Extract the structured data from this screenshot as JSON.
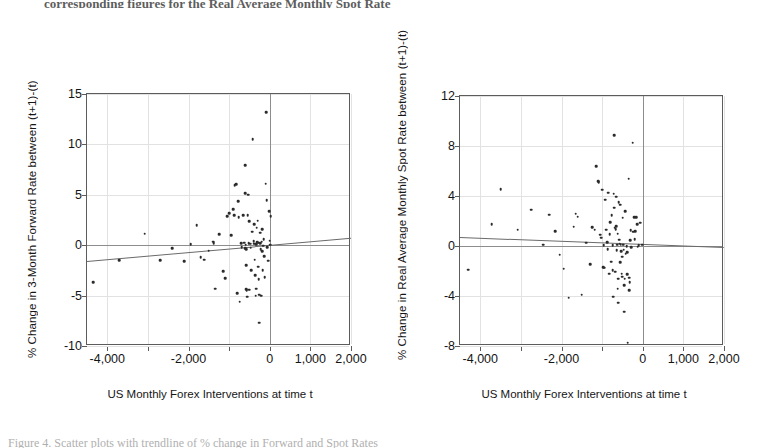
{
  "page": {
    "top_cropped_text": "corresponding figures for the Real Average Monthly Spot Rate",
    "bottom_cropped_text": "Figure 4. Scatter plots with trendline of % change in Forward and Spot Rates"
  },
  "chart_data": [
    {
      "type": "scatter",
      "id": "forward-rate-scatter",
      "title": "",
      "xlabel": "US Monthly Forex Interventions at time t",
      "ylabel": "% Change in 3-Month Forward Rate between (t+1)-(t)",
      "xlim": [
        -4500,
        2000
      ],
      "ylim": [
        -10,
        15
      ],
      "xticks": [
        -4000,
        -3000,
        -2000,
        -1000,
        0,
        1000,
        2000
      ],
      "xticklabels": [
        "-4,000",
        "",
        "-2,000",
        "",
        "0",
        "1,000",
        "2,000"
      ],
      "yticks": [
        -10,
        -5,
        0,
        5,
        10,
        15
      ],
      "yticklabels": [
        "-10",
        "-5",
        "0",
        "5",
        "10",
        "15"
      ],
      "grid": true,
      "legend": "none",
      "trendline": {
        "x0": -4500,
        "y0": -1.55,
        "x1": 2000,
        "y1": 0.75
      },
      "points": [
        [
          -4350,
          -3.7
        ],
        [
          -3700,
          -1.5
        ],
        [
          -3080,
          1.15
        ],
        [
          -2700,
          -1.5
        ],
        [
          -2400,
          -0.3
        ],
        [
          -2100,
          -1.6
        ],
        [
          -1950,
          0.1
        ],
        [
          -1800,
          2.0
        ],
        [
          -1700,
          -1.2
        ],
        [
          -1620,
          -1.45
        ],
        [
          -1500,
          -0.55
        ],
        [
          -1400,
          0.35
        ],
        [
          -1380,
          0.2
        ],
        [
          -1350,
          -4.3
        ],
        [
          -1250,
          1.1
        ],
        [
          -1150,
          -2.6
        ],
        [
          -1100,
          -3.3
        ],
        [
          -1050,
          2.9
        ],
        [
          -1000,
          3.2
        ],
        [
          -950,
          1.0
        ],
        [
          -900,
          3.55
        ],
        [
          -870,
          2.95
        ],
        [
          -860,
          5.95
        ],
        [
          -820,
          6.05
        ],
        [
          -800,
          -4.75
        ],
        [
          -770,
          4.35
        ],
        [
          -760,
          2.8
        ],
        [
          -740,
          -5.6
        ],
        [
          -700,
          0.2
        ],
        [
          -690,
          -0.2
        ],
        [
          -650,
          2.95
        ],
        [
          -630,
          0.25
        ],
        [
          -610,
          5.15
        ],
        [
          -600,
          7.95
        ],
        [
          -600,
          -0.3
        ],
        [
          -590,
          0.05
        ],
        [
          -585,
          -0.4
        ],
        [
          -580,
          -2.0
        ],
        [
          -575,
          -4.35
        ],
        [
          -570,
          -4.45
        ],
        [
          -560,
          -5.1
        ],
        [
          -540,
          3.0
        ],
        [
          -530,
          5.0
        ],
        [
          -520,
          0.2
        ],
        [
          -510,
          2.4
        ],
        [
          -500,
          -4.4
        ],
        [
          -480,
          0.15
        ],
        [
          -470,
          -0.25
        ],
        [
          -450,
          -2.5
        ],
        [
          -430,
          1.35
        ],
        [
          -420,
          10.5
        ],
        [
          -400,
          0.4
        ],
        [
          -390,
          2.1
        ],
        [
          -380,
          0.15
        ],
        [
          -370,
          -1.45
        ],
        [
          -360,
          -3.0
        ],
        [
          -350,
          -5.0
        ],
        [
          -340,
          -4.3
        ],
        [
          -330,
          0.1
        ],
        [
          -320,
          1.75
        ],
        [
          -310,
          0.3
        ],
        [
          -300,
          2.45
        ],
        [
          -290,
          0.25
        ],
        [
          -280,
          -2.15
        ],
        [
          -270,
          -3.35
        ],
        [
          -260,
          -4.9
        ],
        [
          -255,
          -7.7
        ],
        [
          -240,
          1.25
        ],
        [
          -230,
          0.2
        ],
        [
          -225,
          -0.4
        ],
        [
          -210,
          -5.0
        ],
        [
          -200,
          0.35
        ],
        [
          -190,
          1.6
        ],
        [
          -180,
          -0.6
        ],
        [
          -170,
          -2.5
        ],
        [
          -160,
          -0.05
        ],
        [
          -150,
          0.6
        ],
        [
          -140,
          -1.1
        ],
        [
          -120,
          -3.2
        ],
        [
          -100,
          6.1
        ],
        [
          -90,
          13.2
        ],
        [
          -80,
          4.45
        ],
        [
          -60,
          -0.2
        ],
        [
          -40,
          -1.55
        ],
        [
          -20,
          3.35
        ],
        [
          0,
          0.45
        ],
        [
          10,
          0.05
        ],
        [
          20,
          2.9
        ]
      ]
    },
    {
      "type": "scatter",
      "id": "spot-rate-scatter",
      "title": "",
      "xlabel": "US Monthly Forex Interventions at time t",
      "ylabel": "% Change in Real Average Monthly Spot Rate between (t+1)-(t)",
      "xlim": [
        -4500,
        2000
      ],
      "ylim": [
        -8,
        12
      ],
      "xticks": [
        -4000,
        -3000,
        -2000,
        -1000,
        0,
        1000,
        2000
      ],
      "xticklabels": [
        "-4,000",
        "",
        "-2,000",
        "",
        "0",
        "1,000",
        "2,000"
      ],
      "yticks": [
        -8,
        -4,
        0,
        4,
        8,
        12
      ],
      "yticklabels": [
        "-8",
        "-4",
        "0",
        "4",
        "8",
        "12"
      ],
      "grid": true,
      "legend": "none",
      "trendline": {
        "x0": -4500,
        "y0": 0.75,
        "x1": 2000,
        "y1": -0.05
      },
      "points": [
        [
          -4300,
          -1.9
        ],
        [
          -3720,
          1.75
        ],
        [
          -3500,
          4.55
        ],
        [
          -3080,
          1.3
        ],
        [
          -2750,
          2.9
        ],
        [
          -2450,
          0.1
        ],
        [
          -2300,
          2.5
        ],
        [
          -2150,
          1.2
        ],
        [
          -2050,
          -0.7
        ],
        [
          -1950,
          -1.8
        ],
        [
          -1820,
          -4.15
        ],
        [
          -1700,
          1.55
        ],
        [
          -1650,
          2.6
        ],
        [
          -1600,
          2.35
        ],
        [
          -1500,
          -3.9
        ],
        [
          -1400,
          0.25
        ],
        [
          -1300,
          -1.45
        ],
        [
          -1250,
          1.5
        ],
        [
          -1180,
          1.3
        ],
        [
          -1150,
          6.4
        ],
        [
          -1100,
          5.2
        ],
        [
          -1080,
          5.1
        ],
        [
          -1050,
          0.9
        ],
        [
          -1020,
          0.65
        ],
        [
          -1000,
          4.5
        ],
        [
          -980,
          -1.7
        ],
        [
          -960,
          0.05
        ],
        [
          -950,
          -1.75
        ],
        [
          -930,
          3.7
        ],
        [
          -900,
          1.3
        ],
        [
          -880,
          0.3
        ],
        [
          -860,
          -0.25
        ],
        [
          -850,
          4.25
        ],
        [
          -830,
          -2.2
        ],
        [
          -810,
          0.95
        ],
        [
          -800,
          1.9
        ],
        [
          -780,
          -1.25
        ],
        [
          -760,
          2.45
        ],
        [
          -745,
          0.05
        ],
        [
          -740,
          -1.95
        ],
        [
          -730,
          -4.05
        ],
        [
          -720,
          4.2
        ],
        [
          -710,
          3.05
        ],
        [
          -700,
          8.85
        ],
        [
          -690,
          1.45
        ],
        [
          -680,
          -2.05
        ],
        [
          -670,
          1.35
        ],
        [
          -660,
          1.6
        ],
        [
          -650,
          3.95
        ],
        [
          -640,
          -0.35
        ],
        [
          -630,
          0.1
        ],
        [
          -620,
          1.0
        ],
        [
          -615,
          -3.4
        ],
        [
          -610,
          -4.55
        ],
        [
          -600,
          -2.6
        ],
        [
          -590,
          3.5
        ],
        [
          -580,
          0.5
        ],
        [
          -570,
          0.2
        ],
        [
          -560,
          3.3
        ],
        [
          -550,
          -1.3
        ],
        [
          -540,
          0.1
        ],
        [
          -530,
          -0.4
        ],
        [
          -520,
          -2.2
        ],
        [
          -510,
          -0.85
        ],
        [
          -500,
          -2.45
        ],
        [
          -490,
          2.25
        ],
        [
          -480,
          0.1
        ],
        [
          -470,
          -0.3
        ],
        [
          -460,
          -5.25
        ],
        [
          -450,
          -3.15
        ],
        [
          -440,
          -2.6
        ],
        [
          -430,
          2.8
        ],
        [
          -420,
          -0.6
        ],
        [
          -400,
          0.0
        ],
        [
          -390,
          -0.5
        ],
        [
          -380,
          -2.25
        ],
        [
          -370,
          -7.75
        ],
        [
          -350,
          5.4
        ],
        [
          -340,
          -3.55
        ],
        [
          -330,
          -2.55
        ],
        [
          -320,
          -2.9
        ],
        [
          -310,
          0.45
        ],
        [
          -300,
          1.25
        ],
        [
          -290,
          -0.1
        ],
        [
          -250,
          8.25
        ],
        [
          -230,
          1.15
        ],
        [
          -210,
          2.3
        ],
        [
          -200,
          0.55
        ],
        [
          -180,
          1.2
        ],
        [
          -160,
          2.3
        ],
        [
          -140,
          1.75
        ],
        [
          -120,
          -0.05
        ],
        [
          -100,
          0.05
        ],
        [
          -60,
          1.85
        ],
        [
          -20,
          0.1
        ]
      ]
    }
  ]
}
